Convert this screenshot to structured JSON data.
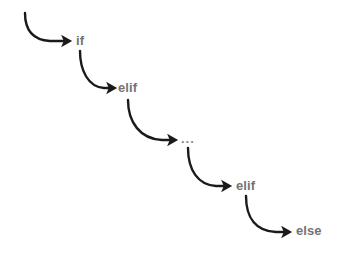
{
  "diagram": {
    "background_color": "#ffffff",
    "label_color": "#737373",
    "ellipsis_color": "#8a8a8a",
    "arrow_color": "#1a1a1a",
    "arrow_stroke_width": 2.4,
    "canvas": {
      "width": 345,
      "height": 255
    },
    "nodes": [
      {
        "id": "if",
        "label": "if",
        "x": 76,
        "y": 34,
        "kind": "keyword"
      },
      {
        "id": "elif1",
        "label": "elif",
        "x": 118,
        "y": 81,
        "kind": "keyword"
      },
      {
        "id": "dots",
        "label": "...",
        "x": 181,
        "y": 132,
        "kind": "ellipsis"
      },
      {
        "id": "elif2",
        "label": "elif",
        "x": 236,
        "y": 179,
        "kind": "keyword"
      },
      {
        "id": "else",
        "label": "else",
        "x": 296,
        "y": 224,
        "kind": "keyword"
      }
    ],
    "edges": [
      {
        "id": "edge-entry-if",
        "from": "entry",
        "to": "if",
        "path": "M 25,13 C 25,30 32,40 50,41 L 64,41",
        "arrow_tip": {
          "x": 72,
          "y": 41
        }
      },
      {
        "id": "edge-if-elif1",
        "from": "if",
        "to": "elif1",
        "path": "M 80,51 C 80,70 88,87 104,88 L 109,88",
        "arrow_tip": {
          "x": 117,
          "y": 88
        }
      },
      {
        "id": "edge-elif1-dots",
        "from": "elif1",
        "to": "dots",
        "path": "M 128,100 C 128,122 140,139 162,140 L 170,140",
        "arrow_tip": {
          "x": 178,
          "y": 140
        }
      },
      {
        "id": "edge-dots-elif2",
        "from": "dots",
        "to": "elif2",
        "path": "M 188,148 C 188,170 198,185 216,186 L 224,186",
        "arrow_tip": {
          "x": 232,
          "y": 186
        }
      },
      {
        "id": "edge-elif2-else",
        "from": "elif2",
        "to": "else",
        "path": "M 246,196 C 246,218 256,231 276,232 L 284,232",
        "arrow_tip": {
          "x": 292,
          "y": 232
        }
      }
    ]
  }
}
